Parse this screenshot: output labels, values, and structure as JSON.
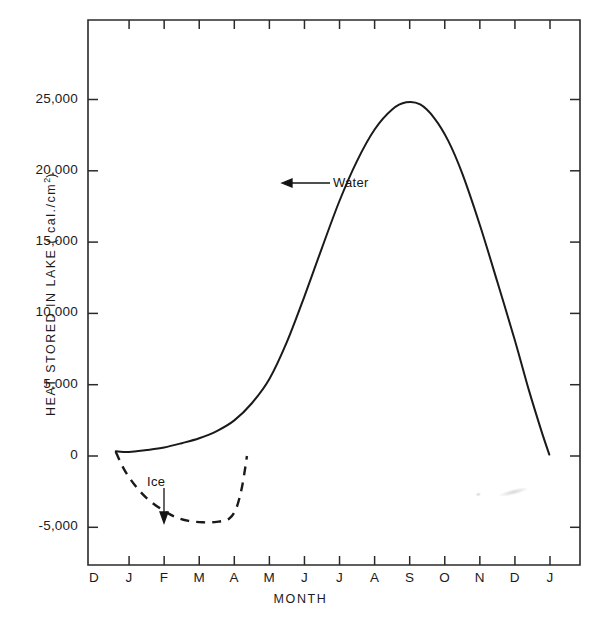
{
  "chart_data": {
    "type": "line",
    "title": "",
    "xlabel": "MONTH",
    "ylabel": "HEAT STORED IN LAKE ( cal./cm2)",
    "ylabel_main": "HEAT STORED IN LAKE  ( cal./cm",
    "ylabel_exponent": "2",
    "ylabel_tail": ")",
    "x_categories": [
      "D",
      "J",
      "F",
      "M",
      "A",
      "M",
      "J",
      "J",
      "A",
      "S",
      "O",
      "N",
      "D",
      "J"
    ],
    "y_ticks": [
      "25,000",
      "20,000",
      "15,000",
      "10,000",
      "5,000",
      "0",
      "-5,000"
    ],
    "y_tick_values": [
      25000,
      20000,
      15000,
      10000,
      5000,
      0,
      -5000
    ],
    "ylim": [
      -7000,
      28500
    ],
    "xlim": [
      0,
      13
    ],
    "grid": false,
    "legend": "none",
    "series": [
      {
        "name": "Water",
        "style": "solid",
        "annotation": "Water",
        "annotation_arrow": "left-arrow",
        "points": [
          {
            "x": 0.62,
            "y": 330
          },
          {
            "x": 1.0,
            "y": 280
          },
          {
            "x": 1.5,
            "y": 420
          },
          {
            "x": 2.0,
            "y": 600
          },
          {
            "x": 2.5,
            "y": 900
          },
          {
            "x": 3.0,
            "y": 1250
          },
          {
            "x": 3.5,
            "y": 1750
          },
          {
            "x": 4.0,
            "y": 2500
          },
          {
            "x": 4.5,
            "y": 3700
          },
          {
            "x": 5.0,
            "y": 5400
          },
          {
            "x": 5.5,
            "y": 8000
          },
          {
            "x": 6.0,
            "y": 11200
          },
          {
            "x": 6.5,
            "y": 14600
          },
          {
            "x": 7.0,
            "y": 17900
          },
          {
            "x": 7.5,
            "y": 20700
          },
          {
            "x": 8.0,
            "y": 22900
          },
          {
            "x": 8.5,
            "y": 24300
          },
          {
            "x": 8.9,
            "y": 24800
          },
          {
            "x": 9.3,
            "y": 24650
          },
          {
            "x": 9.7,
            "y": 23700
          },
          {
            "x": 10.1,
            "y": 22100
          },
          {
            "x": 10.5,
            "y": 19800
          },
          {
            "x": 11.0,
            "y": 16200
          },
          {
            "x": 11.5,
            "y": 12200
          },
          {
            "x": 12.0,
            "y": 8100
          },
          {
            "x": 12.4,
            "y": 4600
          },
          {
            "x": 12.75,
            "y": 1800
          },
          {
            "x": 12.98,
            "y": 100
          }
        ]
      },
      {
        "name": "Ice",
        "style": "dashed",
        "annotation": "Ice",
        "annotation_arrow": "down-arrow",
        "points": [
          {
            "x": 0.62,
            "y": 300
          },
          {
            "x": 0.85,
            "y": -900
          },
          {
            "x": 1.15,
            "y": -2000
          },
          {
            "x": 1.5,
            "y": -2950
          },
          {
            "x": 1.9,
            "y": -3700
          },
          {
            "x": 2.3,
            "y": -4250
          },
          {
            "x": 2.7,
            "y": -4550
          },
          {
            "x": 3.1,
            "y": -4650
          },
          {
            "x": 3.5,
            "y": -4620
          },
          {
            "x": 3.85,
            "y": -4400
          },
          {
            "x": 4.05,
            "y": -3700
          },
          {
            "x": 4.2,
            "y": -2400
          },
          {
            "x": 4.3,
            "y": -1000
          },
          {
            "x": 4.36,
            "y": 0
          }
        ]
      }
    ],
    "annotations": [
      {
        "text": "Water",
        "target_series": "Water",
        "arrow": "left"
      },
      {
        "text": "Ice",
        "target_series": "Ice",
        "arrow": "down"
      }
    ]
  }
}
